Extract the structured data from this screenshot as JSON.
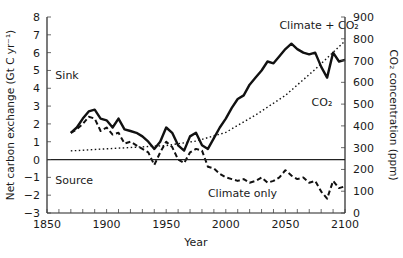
{
  "chart_data": {
    "type": "line",
    "title": "",
    "xlabel": "Year",
    "ylabel": "Net carbon exchange (Gt C yr⁻¹)",
    "ylabel_right": "CO₂ concentration (ppm)",
    "xlim": [
      1850,
      2100
    ],
    "ylim": [
      -3,
      8
    ],
    "ylim_right": [
      0,
      900
    ],
    "x_ticks": [
      1850,
      1900,
      1950,
      2000,
      2050,
      2100
    ],
    "y_ticks": [
      -3,
      -2,
      -1,
      0,
      1,
      2,
      3,
      4,
      5,
      6,
      7,
      8
    ],
    "y_ticks_right": [
      0,
      100,
      200,
      300,
      400,
      500,
      600,
      700,
      800,
      900
    ],
    "grid": false,
    "zero_line": true,
    "annotations": [
      {
        "text": "Sink",
        "x": 1857,
        "y": 4.5
      },
      {
        "text": "Source",
        "x": 1857,
        "y": -1.4
      },
      {
        "text": "Climate + CO₂",
        "x": 2045,
        "y": 7.3
      },
      {
        "text": "CO₂",
        "x": 2072,
        "y": 3.0
      },
      {
        "text": "Climate only",
        "x": 1985,
        "y": -2.1
      }
    ],
    "series": [
      {
        "name": "Climate + CO₂",
        "axis": "left",
        "style": "solid-thick",
        "x": [
          1870,
          1875,
          1880,
          1885,
          1890,
          1895,
          1900,
          1905,
          1910,
          1915,
          1920,
          1925,
          1930,
          1935,
          1940,
          1945,
          1950,
          1955,
          1960,
          1965,
          1970,
          1975,
          1980,
          1985,
          1990,
          1995,
          2000,
          2005,
          2010,
          2015,
          2020,
          2025,
          2030,
          2035,
          2040,
          2045,
          2050,
          2055,
          2060,
          2065,
          2070,
          2075,
          2080,
          2085,
          2090,
          2095,
          2100
        ],
        "values": [
          1.5,
          1.8,
          2.3,
          2.7,
          2.8,
          2.3,
          2.2,
          1.8,
          2.3,
          1.7,
          1.6,
          1.5,
          1.3,
          1.0,
          0.6,
          1.0,
          1.8,
          1.5,
          0.8,
          0.5,
          1.3,
          1.5,
          0.8,
          0.6,
          1.2,
          1.8,
          2.3,
          2.9,
          3.4,
          3.6,
          4.2,
          4.6,
          5.0,
          5.5,
          5.4,
          5.8,
          6.2,
          6.5,
          6.2,
          6.0,
          5.9,
          6.0,
          5.2,
          4.6,
          6.0,
          5.5,
          5.6
        ]
      },
      {
        "name": "Climate only",
        "axis": "left",
        "style": "dashed-thick",
        "x": [
          1870,
          1875,
          1880,
          1885,
          1890,
          1895,
          1900,
          1905,
          1910,
          1915,
          1920,
          1925,
          1930,
          1935,
          1940,
          1945,
          1950,
          1955,
          1960,
          1965,
          1970,
          1975,
          1980,
          1985,
          1990,
          1995,
          2000,
          2005,
          2010,
          2015,
          2020,
          2025,
          2030,
          2035,
          2040,
          2045,
          2050,
          2055,
          2060,
          2065,
          2070,
          2075,
          2080,
          2085,
          2090,
          2095,
          2100
        ],
        "values": [
          1.5,
          1.7,
          2.0,
          2.4,
          2.3,
          1.6,
          1.8,
          1.4,
          1.5,
          0.9,
          1.0,
          0.8,
          0.6,
          0.4,
          -0.3,
          0.4,
          1.0,
          0.7,
          0.0,
          -0.2,
          0.4,
          0.6,
          0.5,
          -0.4,
          -0.5,
          -0.8,
          -1.0,
          -1.1,
          -1.2,
          -1.1,
          -1.3,
          -1.2,
          -1.0,
          -1.3,
          -1.2,
          -1.0,
          -0.6,
          -0.9,
          -1.1,
          -1.0,
          -1.3,
          -1.2,
          -1.8,
          -2.2,
          -1.2,
          -1.6,
          -1.5
        ]
      },
      {
        "name": "CO₂",
        "axis": "right",
        "style": "dotted",
        "x": [
          1870,
          1900,
          1925,
          1950,
          1975,
          2000,
          2025,
          2050,
          2075,
          2100
        ],
        "values": [
          285,
          295,
          302,
          310,
          330,
          370,
          450,
          540,
          660,
          790
        ]
      }
    ]
  }
}
